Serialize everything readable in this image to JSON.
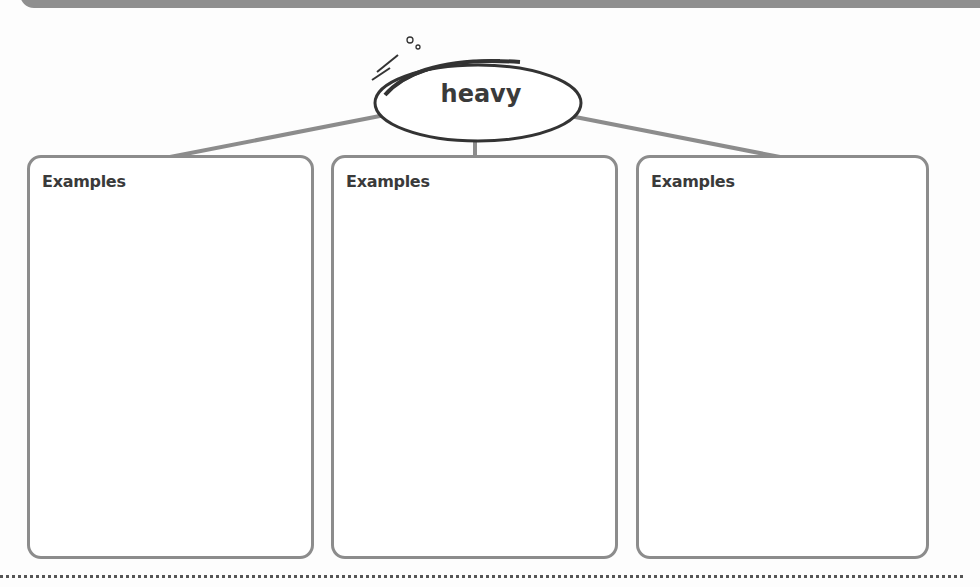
{
  "concept": {
    "word": "heavy"
  },
  "boxes": [
    {
      "label": "Examples"
    },
    {
      "label": "Examples"
    },
    {
      "label": "Examples"
    }
  ],
  "colors": {
    "border": "#8c8c8c",
    "text": "#3a3a3a",
    "band": "#8f8f8f"
  }
}
